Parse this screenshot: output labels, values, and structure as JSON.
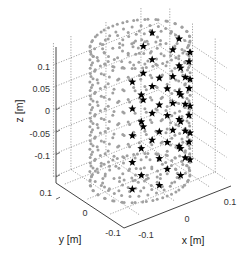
{
  "chart_data": {
    "type": "scatter3d",
    "title": "",
    "xlabel": "x [m]",
    "ylabel": "y [m]",
    "zlabel": "z [m]",
    "xlim": [
      -0.15,
      0.15
    ],
    "ylim": [
      -0.15,
      0.15
    ],
    "zlim": [
      -0.15,
      0.15
    ],
    "xticks": [
      "-0.1",
      "0",
      "0.1"
    ],
    "yticks": [
      "0.1",
      "0",
      "-0.1"
    ],
    "zticks": [
      "0.1",
      "0.05",
      "0",
      "-0.05",
      "-0.1"
    ],
    "grid": true,
    "legend": null,
    "series": [
      {
        "name": "candidate points (cylinder surface + end-cap rings)",
        "marker": "dot",
        "color": "#a0a0a0",
        "shape": "cylinder",
        "radius": 0.12,
        "z_range": [
          -0.15,
          0.15
        ],
        "end_caps": {
          "z": [
            0.15,
            -0.15
          ],
          "ring_radii": [
            0.02,
            0.05,
            0.09,
            0.12
          ]
        }
      },
      {
        "name": "selected points",
        "marker": "star",
        "color": "#000000",
        "shape": "cylinder columns",
        "radius": 0.12,
        "z_levels": [
          0.12,
          0.09,
          0.06,
          0.03,
          0.0,
          -0.03,
          -0.06,
          -0.09,
          -0.12
        ]
      }
    ]
  },
  "labels": {
    "x_axis": "x [m]",
    "y_axis": "y [m]",
    "z_axis": "z [m]",
    "z_ticks": [
      "0.1",
      "0.05",
      "0",
      "-0.05",
      "-0.1"
    ],
    "y_ticks": [
      "0.1",
      "0",
      "-0.1"
    ],
    "x_ticks": [
      "-0.1",
      "0",
      "0.1"
    ]
  },
  "colors": {
    "dots": "#a0a0a0",
    "stars": "#000000",
    "axis": "#444444",
    "grid": "#666666"
  }
}
